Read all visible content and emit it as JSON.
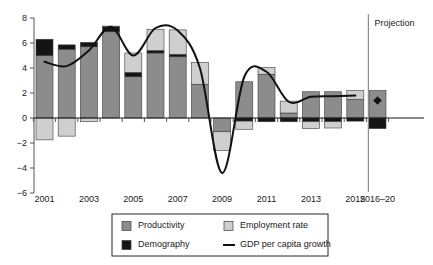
{
  "chart_data": {
    "type": "bar",
    "title": "",
    "subtitle": "",
    "xlabel": "",
    "ylabel": "",
    "ylim": [
      -6,
      8
    ],
    "ytick_values": [
      -6,
      -4,
      -2,
      0,
      2,
      4,
      6,
      8
    ],
    "ytick_labels": [
      "−6",
      "−4",
      "−2",
      "0",
      "2",
      "4",
      "6",
      "8"
    ],
    "grid": false,
    "stacked": true,
    "legend_position": "bottom",
    "categories": [
      "2001",
      "2002",
      "2003",
      "2004",
      "2005",
      "2006",
      "2007",
      "2008",
      "2009",
      "2010",
      "2011",
      "2012",
      "2013",
      "2014",
      "2015",
      "2016–20"
    ],
    "xtick_labels": [
      "2001",
      "2003",
      "2005",
      "2007",
      "2009",
      "2011",
      "2013",
      "2015",
      "2016–20"
    ],
    "xtick_categories": [
      "2001",
      "2003",
      "2005",
      "2007",
      "2009",
      "2011",
      "2013",
      "2015",
      "2016–20"
    ],
    "series": [
      {
        "name": "Productivity",
        "color": "#8c8c8c",
        "values": [
          5.0,
          5.5,
          5.7,
          6.9,
          3.3,
          5.2,
          4.9,
          2.7,
          -1.1,
          2.9,
          3.5,
          0.4,
          2.1,
          2.1,
          1.5,
          2.2
        ]
      },
      {
        "name": "Demography",
        "color": "#141414",
        "values": [
          1.3,
          0.35,
          0.35,
          0.4,
          0.35,
          0.2,
          0.2,
          0.0,
          0.0,
          -0.25,
          -0.3,
          -0.3,
          -0.3,
          -0.3,
          -0.25,
          -0.85
        ]
      },
      {
        "name": "Employment rate",
        "color": "#cfcfcf",
        "values": [
          -1.75,
          -1.45,
          -0.3,
          0.05,
          1.55,
          1.7,
          1.95,
          1.75,
          -1.5,
          -0.65,
          0.55,
          0.95,
          -0.55,
          -0.5,
          0.7,
          0.0
        ]
      }
    ],
    "line_series": {
      "name": "GDP per capita growth",
      "color": "#111111",
      "x": [
        "2001",
        "2002",
        "2003",
        "2004",
        "2005",
        "2006",
        "2007",
        "2008",
        "2009",
        "2010",
        "2011",
        "2012",
        "2013",
        "2014",
        "2015"
      ],
      "values": [
        4.5,
        4.15,
        5.4,
        7.3,
        5.0,
        7.2,
        7.0,
        4.0,
        -4.4,
        3.3,
        3.7,
        1.3,
        1.7,
        1.75,
        1.8
      ]
    },
    "projection": {
      "label": "Projection",
      "category": "2016–20",
      "marker_value": 1.4,
      "marker_shape": "diamond",
      "divider_after_category": "2015"
    },
    "legend": [
      {
        "label": "Productivity",
        "type": "swatch",
        "color": "#8c8c8c"
      },
      {
        "label": "Employment rate",
        "type": "swatch",
        "color": "#cfcfcf"
      },
      {
        "label": "Demography",
        "type": "swatch",
        "color": "#141414"
      },
      {
        "label": "GDP per capita growth",
        "type": "line",
        "color": "#111111"
      }
    ]
  }
}
